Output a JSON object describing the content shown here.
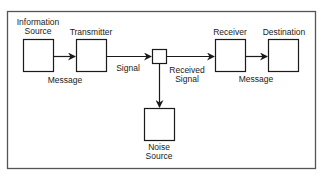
{
  "diagram": {
    "nodes": {
      "information_source": {
        "line1": "Information",
        "line2": "Source"
      },
      "transmitter": {
        "label": "Transmitter"
      },
      "receiver": {
        "label": "Receiver"
      },
      "destination": {
        "label": "Destination"
      },
      "noise_source": {
        "line1": "Noise",
        "line2": "Source"
      }
    },
    "edges": {
      "message_1": "Message",
      "signal": "Signal",
      "received_signal": {
        "line1": "Received",
        "line2": "Signal"
      },
      "message_2": "Message"
    },
    "colors": {
      "stroke": "#1a1a1a",
      "frame": "#555555",
      "background": "#ffffff"
    }
  }
}
